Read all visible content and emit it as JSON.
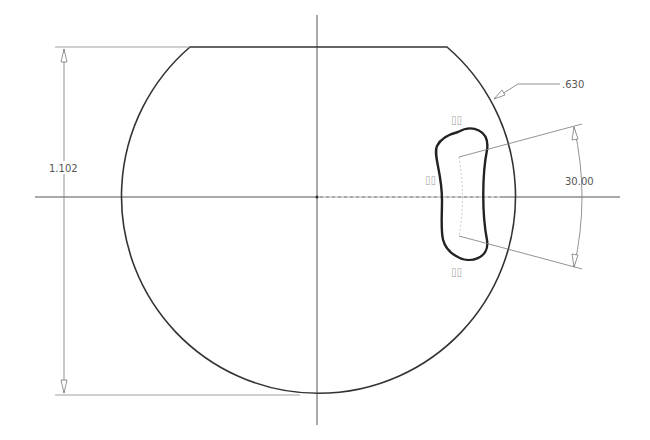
{
  "drawing": {
    "type": "2D sketch",
    "dimensions": {
      "height_label": "1.102",
      "radius_label": ".630",
      "angle_label": "30.00"
    },
    "constraint_glyph": "⌷⌷",
    "colors": {
      "profile": "#333333",
      "dimension": "#666666",
      "centerline": "#555555",
      "construction": "#bbbbbb",
      "text": "#555555"
    }
  }
}
